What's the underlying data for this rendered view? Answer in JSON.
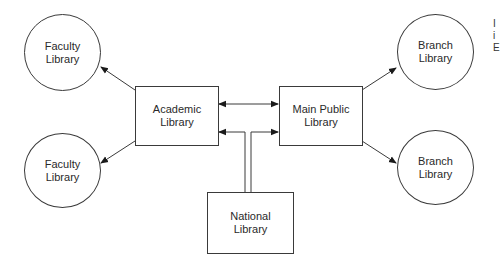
{
  "diagram": {
    "type": "library-network",
    "nodes": [
      {
        "id": "faculty-1",
        "shape": "circle",
        "lines": [
          "Faculty",
          "Library"
        ]
      },
      {
        "id": "faculty-2",
        "shape": "circle",
        "lines": [
          "Faculty",
          "Library"
        ]
      },
      {
        "id": "academic",
        "shape": "rect",
        "lines": [
          "Academic",
          "Library"
        ]
      },
      {
        "id": "main-public",
        "shape": "rect",
        "lines": [
          "Main Public",
          "Library"
        ]
      },
      {
        "id": "national",
        "shape": "rect",
        "lines": [
          "National",
          "Library"
        ]
      },
      {
        "id": "branch-1",
        "shape": "circle",
        "lines": [
          "Branch",
          "Library"
        ]
      },
      {
        "id": "branch-2",
        "shape": "circle",
        "lines": [
          "Branch",
          "Library"
        ]
      }
    ],
    "edges": [
      {
        "from": "academic",
        "to": "faculty-1",
        "arrow": "end"
      },
      {
        "from": "academic",
        "to": "faculty-2",
        "arrow": "end"
      },
      {
        "from": "academic",
        "to": "main-public",
        "arrow": "both"
      },
      {
        "from": "national",
        "to": "academic",
        "arrow": "end"
      },
      {
        "from": "national",
        "to": "main-public",
        "arrow": "end"
      },
      {
        "from": "main-public",
        "to": "branch-1",
        "arrow": "end"
      },
      {
        "from": "main-public",
        "to": "branch-2",
        "arrow": "end"
      }
    ],
    "cropped_text": [
      "I",
      "i",
      "E"
    ],
    "colors": {
      "line": "#3a3a3a",
      "background": "#ffffff",
      "text": "#2a2a2a"
    }
  }
}
